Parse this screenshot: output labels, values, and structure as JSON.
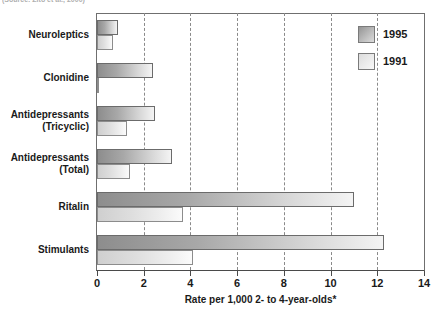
{
  "source_note": "(Source: Zito et al., 2000)",
  "chart_data": {
    "type": "bar",
    "orientation": "horizontal",
    "title": "",
    "xlabel": "Rate per 1,000 2- to 4-year-olds*",
    "ylabel": "",
    "xlim": [
      0,
      14
    ],
    "xticks": [
      0,
      2,
      4,
      6,
      8,
      10,
      12,
      14
    ],
    "xtick_labels": [
      "0",
      "2",
      "4",
      "6",
      "8",
      "10",
      "12",
      "14"
    ],
    "grid": "vertical-dashed",
    "legend_position": "top-right",
    "categories": [
      "Neuroleptics",
      "Clonidine",
      "Antidepressants (Tricyclic)",
      "Antidepressants (Total)",
      "Ritalin",
      "Stimulants"
    ],
    "category_lines": [
      [
        "Neuroleptics"
      ],
      [
        "Clonidine"
      ],
      [
        "Antidepressants",
        "(Tricyclic)"
      ],
      [
        "Antidepressants",
        "(Total)"
      ],
      [
        "Ritalin"
      ],
      [
        "Stimulants"
      ]
    ],
    "series": [
      {
        "name": "1995",
        "color": "#a8a8a8",
        "values": [
          0.9,
          2.4,
          2.5,
          3.2,
          11.0,
          12.3
        ]
      },
      {
        "name": "1991",
        "color": "#e2e2e2",
        "values": [
          0.7,
          0.1,
          1.3,
          1.4,
          3.7,
          4.1
        ]
      }
    ]
  },
  "legend": {
    "entries": [
      {
        "label": "1995",
        "swatch": "y1995"
      },
      {
        "label": "1991",
        "swatch": "y1991"
      }
    ]
  }
}
